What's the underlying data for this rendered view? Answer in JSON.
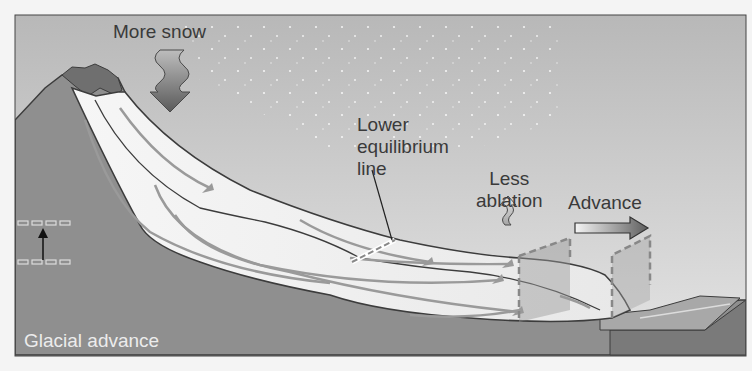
{
  "diagram": {
    "title": "Glacial advance",
    "labels": {
      "more_snow": "More snow",
      "equilibrium_line": "Lower\nequilibrium\nline",
      "less_ablation": "Less\nablation",
      "advance": "Advance"
    },
    "colors": {
      "sky_top": "#b9b9b9",
      "sky_bottom": "#e6e6e6",
      "rock": "#8e8e8e",
      "ice": "#f0f0f0",
      "outline": "#3c3c3c",
      "flow_arrow": "#9a9a9a",
      "snow_arrow": "#6e6e6e",
      "dashed_plane": "#8a8a8a",
      "caption": "#ececec"
    },
    "elements": [
      "more-snow-arrow",
      "equilibrium-line-marker",
      "less-ablation-arrow",
      "advance-arrow",
      "glacier-terminus-plane-old",
      "glacier-terminus-plane-new",
      "equilibrium-line-rise-indicator"
    ]
  }
}
